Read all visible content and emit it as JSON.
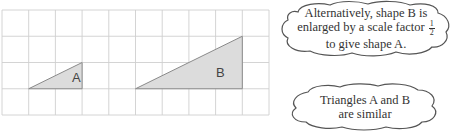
{
  "grid": {
    "x0": 2,
    "y0": 10,
    "cols": 10,
    "rows": 4,
    "cell_w": 26.7,
    "cell_h": 26.25,
    "line_color": "#cfcfcf"
  },
  "shapes": [
    {
      "name": "A",
      "label": "A",
      "points": [
        [
          1,
          3
        ],
        [
          3,
          3
        ],
        [
          3,
          2
        ]
      ],
      "fill": "#dcdcdc",
      "stroke": "#8a8a8a",
      "label_pos": [
        72,
        82
      ]
    },
    {
      "name": "B",
      "label": "B",
      "points": [
        [
          5,
          3
        ],
        [
          9,
          3
        ],
        [
          9,
          1
        ]
      ],
      "fill": "#dcdcdc",
      "stroke": "#8a8a8a",
      "label_pos": [
        216,
        77
      ]
    }
  ],
  "callouts": {
    "top": {
      "line1": "Alternatively, shape B is",
      "line2": "enlarged by a scale factor",
      "line3": "to give shape A.",
      "fraction_num": "1",
      "fraction_den": "2"
    },
    "bottom": {
      "line1": "Triangles A and B",
      "line2": "are similar"
    }
  }
}
